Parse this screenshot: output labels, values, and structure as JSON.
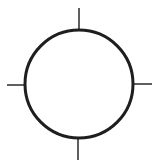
{
  "diagram": {
    "title": "",
    "shape": "circle-with-crosshair-ticks",
    "circle": {
      "cx": 79,
      "cy": 84,
      "r": 54,
      "stroke": "#1e1e1e",
      "stroke_width": 3,
      "fill": "#ffffff"
    },
    "ticks": [
      {
        "name": "top",
        "x1": 79,
        "y1": 8,
        "x2": 79,
        "y2": 30
      },
      {
        "name": "right",
        "x1": 132,
        "y1": 84,
        "x2": 152,
        "y2": 84
      },
      {
        "name": "bottom",
        "x1": 78,
        "y1": 138,
        "x2": 78,
        "y2": 160
      },
      {
        "name": "left",
        "x1": 7,
        "y1": 85,
        "x2": 27,
        "y2": 85
      }
    ],
    "tick_color": "#2a2a2a",
    "tick_width": 1.5
  }
}
